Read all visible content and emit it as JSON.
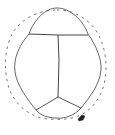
{
  "diagram": {
    "type": "line-drawing",
    "colors": {
      "stroke": "#555555",
      "dashed_stroke": "#666666",
      "mark": "#222222",
      "background": "#ffffff"
    },
    "elements": {
      "outer_solid_outline": "solid-contour",
      "outer_dashed_outline": "dashed-contour",
      "transverse_line": "horizontal-division",
      "midline": "vertical-division",
      "lower_branches": "y-branch-division",
      "marker": "small-dark-mark"
    }
  }
}
